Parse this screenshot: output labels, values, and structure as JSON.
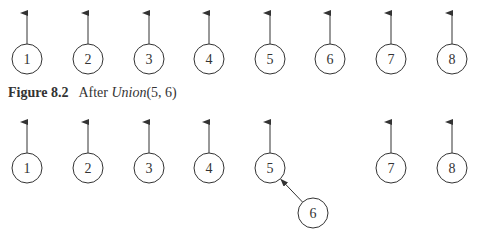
{
  "figure_top": {
    "nodes": [
      {
        "label": "1",
        "x": 27,
        "y": 59
      },
      {
        "label": "2",
        "x": 88,
        "y": 59
      },
      {
        "label": "3",
        "x": 149,
        "y": 59
      },
      {
        "label": "4",
        "x": 209,
        "y": 59
      },
      {
        "label": "5",
        "x": 270,
        "y": 59
      },
      {
        "label": "6",
        "x": 330,
        "y": 59
      },
      {
        "label": "7",
        "x": 391,
        "y": 59
      },
      {
        "label": "8",
        "x": 452,
        "y": 59
      }
    ]
  },
  "caption": {
    "figure_label": "Figure 8.2",
    "text_prefix": "After ",
    "function_name": "Union",
    "args": "(5, 6)"
  },
  "figure_bottom": {
    "nodes": [
      {
        "label": "1",
        "x": 27,
        "y": 168,
        "root": true
      },
      {
        "label": "2",
        "x": 88,
        "y": 168,
        "root": true
      },
      {
        "label": "3",
        "x": 149,
        "y": 168,
        "root": true
      },
      {
        "label": "4",
        "x": 209,
        "y": 168,
        "root": true
      },
      {
        "label": "5",
        "x": 270,
        "y": 168,
        "root": true
      },
      {
        "label": "6",
        "x": 313,
        "y": 213,
        "root": false,
        "parent": "5"
      },
      {
        "label": "7",
        "x": 391,
        "y": 168,
        "root": true
      },
      {
        "label": "8",
        "x": 452,
        "y": 168,
        "root": true
      }
    ]
  }
}
